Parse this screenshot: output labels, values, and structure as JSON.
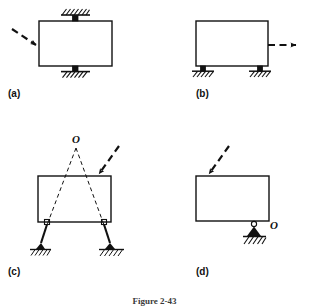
{
  "figure": {
    "caption": "Figure 2-43",
    "panels": [
      {
        "id": "a",
        "label": "(a)",
        "body_shape": "rectangle",
        "supports": [
          {
            "type": "pin-support-hatched",
            "position": "top-center",
            "note": "fixed pin on top edge with ground hatching"
          },
          {
            "type": "pin-support-hatched",
            "position": "bottom-center",
            "note": "fixed pin on bottom edge with ground hatching"
          }
        ],
        "force": {
          "style": "dashed-arrow",
          "direction": "down-right",
          "applied_at": "left-edge-midheight"
        }
      },
      {
        "id": "b",
        "label": "(b)",
        "body_shape": "rectangle",
        "supports": [
          {
            "type": "pin-support-hatched",
            "position": "bottom-left",
            "note": "pin support with ground hatching"
          },
          {
            "type": "pin-support-hatched",
            "position": "bottom-right",
            "note": "pin support with ground hatching"
          }
        ],
        "force": {
          "style": "dashed-arrow",
          "direction": "right",
          "applied_at": "right-edge-midheight"
        }
      },
      {
        "id": "c",
        "label": "(c)",
        "body_shape": "rectangle",
        "point_label": "O",
        "supports": [
          {
            "type": "two-force-link-pin",
            "position": "bottom-left",
            "note": "inclined link, pin at body and pin at hatched ground"
          },
          {
            "type": "two-force-link-pin",
            "position": "bottom-right",
            "note": "inclined link, pin at body and pin at hatched ground"
          }
        ],
        "construction_lines": {
          "style": "dashed",
          "note": "link axes extended upward intersecting at instantaneous center O"
        },
        "force": {
          "style": "dashed-arrow",
          "direction": "down-left",
          "applied_at": "top-edge-right-of-center"
        }
      },
      {
        "id": "d",
        "label": "(d)",
        "body_shape": "rectangle",
        "point_label": "O",
        "supports": [
          {
            "type": "pin-support-triangle-hatched",
            "position": "bottom-right",
            "note": "single pin support, triangle on hatched ground, labelled O"
          }
        ],
        "force": {
          "style": "dashed-arrow",
          "direction": "down-right",
          "applied_at": "top-edge-left-of-center"
        }
      }
    ]
  },
  "colors": {
    "ink": "#111111",
    "paper": "#ffffff",
    "caption": "#3a3a3a"
  }
}
